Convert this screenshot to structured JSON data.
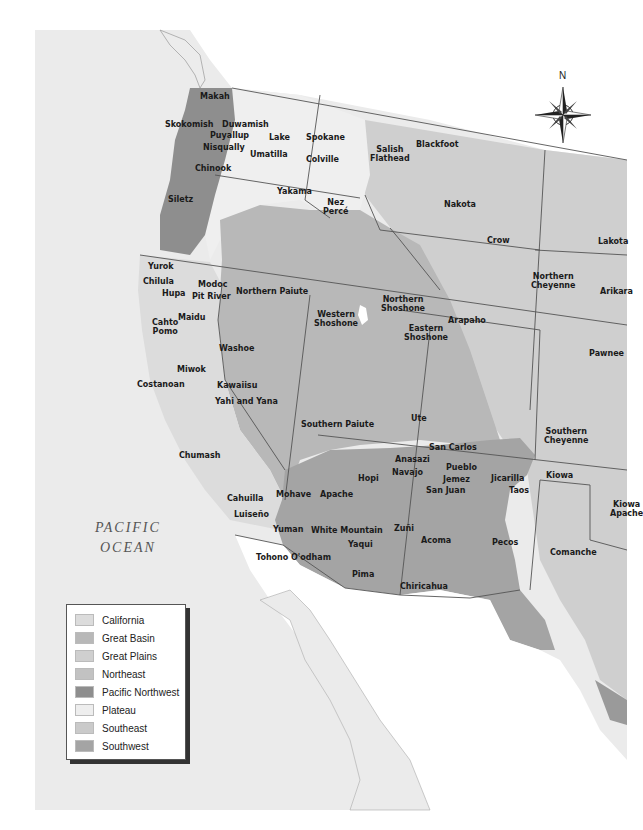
{
  "map": {
    "ocean_label": [
      "PACIFIC",
      "OCEAN"
    ],
    "compass": {
      "north_label": "N"
    },
    "colors": {
      "background": "#ffffff",
      "land_other": "#ececec",
      "california": "#dcdcdc",
      "great_basin": "#b8b8b8",
      "great_plains": "#cfcfcf",
      "northeast": "#c2c2c2",
      "pacific_northwest": "#8e8e8e",
      "plateau": "#eeeeee",
      "southeast": "#cacaca",
      "southwest": "#a4a4a4",
      "border": "#555555"
    },
    "tribes": [
      {
        "name": "Makah",
        "x": 200,
        "y": 92
      },
      {
        "name": "Skokomish",
        "x": 165,
        "y": 120
      },
      {
        "name": "Duwamish",
        "x": 222,
        "y": 120
      },
      {
        "name": "Puyallup",
        "x": 210,
        "y": 131
      },
      {
        "name": "Nisqually",
        "x": 203,
        "y": 143
      },
      {
        "name": "Chinook",
        "x": 195,
        "y": 164
      },
      {
        "name": "Siletz",
        "x": 168,
        "y": 195
      },
      {
        "name": "Lake",
        "x": 269,
        "y": 133
      },
      {
        "name": "Umatilla",
        "x": 250,
        "y": 150
      },
      {
        "name": "Spokane",
        "x": 306,
        "y": 133
      },
      {
        "name": "Colville",
        "x": 306,
        "y": 155
      },
      {
        "name": "Yakama",
        "x": 277,
        "y": 187
      },
      {
        "name": "Nez\nPercé",
        "x": 323,
        "y": 198
      },
      {
        "name": "Salish\nFlathead",
        "x": 370,
        "y": 145
      },
      {
        "name": "Blackfoot",
        "x": 416,
        "y": 140
      },
      {
        "name": "Nakota",
        "x": 444,
        "y": 200
      },
      {
        "name": "Crow",
        "x": 487,
        "y": 236
      },
      {
        "name": "Lakota",
        "x": 598,
        "y": 237
      },
      {
        "name": "Northern\nCheyenne",
        "x": 531,
        "y": 272
      },
      {
        "name": "Arikara",
        "x": 600,
        "y": 287
      },
      {
        "name": "Yurok",
        "x": 148,
        "y": 262
      },
      {
        "name": "Chilula",
        "x": 143,
        "y": 277
      },
      {
        "name": "Hupa",
        "x": 162,
        "y": 289
      },
      {
        "name": "Modoc",
        "x": 198,
        "y": 280
      },
      {
        "name": "Pit River",
        "x": 192,
        "y": 292
      },
      {
        "name": "Northern Paiute",
        "x": 236,
        "y": 287
      },
      {
        "name": "Maidu",
        "x": 178,
        "y": 313
      },
      {
        "name": "Cahto\nPomo",
        "x": 152,
        "y": 318
      },
      {
        "name": "Western\nShoshone",
        "x": 314,
        "y": 310
      },
      {
        "name": "Northern\nShoshone",
        "x": 381,
        "y": 295
      },
      {
        "name": "Eastern\nShoshone",
        "x": 404,
        "y": 324
      },
      {
        "name": "Arapaho",
        "x": 448,
        "y": 316
      },
      {
        "name": "Pawnee",
        "x": 589,
        "y": 349
      },
      {
        "name": "Washoe",
        "x": 219,
        "y": 344
      },
      {
        "name": "Miwok",
        "x": 177,
        "y": 365
      },
      {
        "name": "Costanoan",
        "x": 137,
        "y": 380
      },
      {
        "name": "Kawaiisu",
        "x": 217,
        "y": 381
      },
      {
        "name": "Yahi and Yana",
        "x": 215,
        "y": 397
      },
      {
        "name": "Southern Paiute",
        "x": 301,
        "y": 420
      },
      {
        "name": "Ute",
        "x": 411,
        "y": 414
      },
      {
        "name": "Southern\nCheyenne",
        "x": 544,
        "y": 427
      },
      {
        "name": "San Carlos",
        "x": 429,
        "y": 443
      },
      {
        "name": "Anasazi",
        "x": 395,
        "y": 455
      },
      {
        "name": "Navajo",
        "x": 392,
        "y": 468
      },
      {
        "name": "Pueblo",
        "x": 446,
        "y": 463
      },
      {
        "name": "Jemez",
        "x": 443,
        "y": 475
      },
      {
        "name": "San Juan",
        "x": 426,
        "y": 486
      },
      {
        "name": "Jicarilla",
        "x": 491,
        "y": 474
      },
      {
        "name": "Taos",
        "x": 509,
        "y": 486
      },
      {
        "name": "Kiowa",
        "x": 546,
        "y": 471
      },
      {
        "name": "Kiowa\nApache",
        "x": 610,
        "y": 500
      },
      {
        "name": "Chumash",
        "x": 179,
        "y": 451
      },
      {
        "name": "Hopi",
        "x": 358,
        "y": 474
      },
      {
        "name": "Cahuilla",
        "x": 227,
        "y": 494
      },
      {
        "name": "Mohave",
        "x": 276,
        "y": 490
      },
      {
        "name": "Apache",
        "x": 320,
        "y": 490
      },
      {
        "name": "Luiseño",
        "x": 234,
        "y": 510
      },
      {
        "name": "Yuman",
        "x": 273,
        "y": 525
      },
      {
        "name": "White Mountain",
        "x": 311,
        "y": 526
      },
      {
        "name": "Zuñi",
        "x": 394,
        "y": 524
      },
      {
        "name": "Acoma",
        "x": 421,
        "y": 536
      },
      {
        "name": "Yaqui",
        "x": 348,
        "y": 540
      },
      {
        "name": "Pecos",
        "x": 492,
        "y": 538
      },
      {
        "name": "Comanche",
        "x": 550,
        "y": 548
      },
      {
        "name": "Tohono O'odham",
        "x": 256,
        "y": 553
      },
      {
        "name": "Pima",
        "x": 352,
        "y": 570
      },
      {
        "name": "Chiricahua",
        "x": 400,
        "y": 582
      }
    ]
  },
  "legend": {
    "items": [
      {
        "label": "California",
        "color": "#dcdcdc"
      },
      {
        "label": "Great Basin",
        "color": "#b8b8b8"
      },
      {
        "label": "Great Plains",
        "color": "#cfcfcf"
      },
      {
        "label": "Northeast",
        "color": "#c2c2c2"
      },
      {
        "label": "Pacific Northwest",
        "color": "#8e8e8e"
      },
      {
        "label": "Plateau",
        "color": "#eeeeee"
      },
      {
        "label": "Southeast",
        "color": "#cacaca"
      },
      {
        "label": "Southwest",
        "color": "#a4a4a4"
      }
    ]
  }
}
